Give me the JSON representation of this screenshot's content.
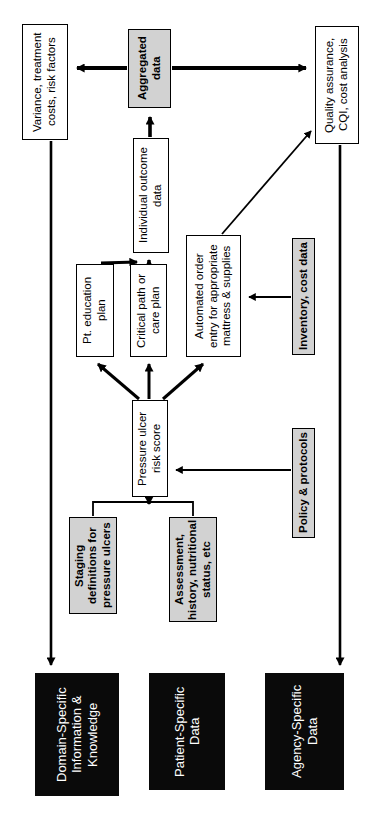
{
  "diagram": {
    "orientation": "rotated-90-ccw",
    "colors": {
      "white_box_fill": "#ffffff",
      "gray_box_fill": "#d2d2d2",
      "black_box_fill": "#0a0a0a",
      "stroke": "#000000",
      "black_box_text": "#ffffff"
    },
    "nodes": [
      {
        "id": "variance",
        "label": "Variance, treatment\ncosts, risk factors",
        "style": "white",
        "x": 22,
        "y": 24,
        "w": 46,
        "h": 116,
        "font": 11.5
      },
      {
        "id": "aggregated",
        "label": "Aggregated\ndata",
        "style": "gray",
        "x": 128,
        "y": 29,
        "w": 43,
        "h": 79,
        "font": 11.5
      },
      {
        "id": "quality",
        "label": "Quality assurance,\nCQI, cost analysis",
        "style": "white",
        "x": 315,
        "y": 26,
        "w": 44,
        "h": 118,
        "font": 11.5
      },
      {
        "id": "individual-outcome",
        "label": "Individual outcome\ndata",
        "style": "white",
        "x": 133,
        "y": 138,
        "w": 36,
        "h": 115,
        "font": 11.5
      },
      {
        "id": "pt-education",
        "label": "Pt. education\nplan",
        "style": "white",
        "x": 76,
        "y": 264,
        "w": 38,
        "h": 93,
        "font": 11.5
      },
      {
        "id": "critical-path",
        "label": "Critical path or\ncare plan",
        "style": "white",
        "x": 130,
        "y": 264,
        "w": 37,
        "h": 93,
        "font": 11.5
      },
      {
        "id": "automated-order",
        "label": "Automated order\nentry for appropriate\nmattress & supplies",
        "style": "white",
        "x": 186,
        "y": 235,
        "w": 55,
        "h": 122,
        "font": 11.5
      },
      {
        "id": "inventory",
        "label": "Inventory, cost data",
        "style": "gray",
        "x": 292,
        "y": 238,
        "w": 23,
        "h": 117,
        "font": 11.5
      },
      {
        "id": "pressure-ulcer",
        "label": "Pressure ulcer\nrisk score",
        "style": "white",
        "x": 132,
        "y": 400,
        "w": 36,
        "h": 97,
        "font": 11.5
      },
      {
        "id": "policy",
        "label": "Policy & protocols",
        "style": "gray",
        "x": 292,
        "y": 428,
        "w": 23,
        "h": 110,
        "font": 11.5
      },
      {
        "id": "staging",
        "label": "Staging\ndefinitions for\npressure ulcers",
        "style": "gray",
        "x": 69,
        "y": 517,
        "w": 48,
        "h": 97,
        "font": 11.5
      },
      {
        "id": "assessment",
        "label": "Assessment,\nhistory, nutritional\nstatus, etc",
        "style": "gray",
        "x": 169,
        "y": 517,
        "w": 48,
        "h": 105,
        "font": 11.5
      },
      {
        "id": "domain-specific",
        "label": "Domain-Specific\nInformation &\nKnowledge",
        "style": "black",
        "x": 35,
        "y": 673,
        "w": 84,
        "h": 123,
        "font": 13
      },
      {
        "id": "patient-specific",
        "label": "Patient-Specific\nData",
        "style": "black",
        "x": 149,
        "y": 673,
        "w": 76,
        "h": 117,
        "font": 13
      },
      {
        "id": "agency-specific",
        "label": "Agency-Specific\nData",
        "style": "black",
        "x": 265,
        "y": 673,
        "w": 79,
        "h": 117,
        "font": 13
      }
    ],
    "edges": [
      {
        "id": "aggregated-to-variance",
        "from": "aggregated",
        "to": "variance",
        "kind": "arrow-thick"
      },
      {
        "id": "aggregated-to-quality",
        "from": "aggregated",
        "to": "quality",
        "kind": "arrow-thick"
      },
      {
        "id": "individual-to-aggregated",
        "from": "individual-outcome",
        "to": "aggregated",
        "kind": "arrow-thick"
      },
      {
        "id": "pt-education-to-individual",
        "from": "pt-education",
        "to": "individual-outcome",
        "kind": "arrow-thick"
      },
      {
        "id": "critical-path-to-individual",
        "from": "critical-path",
        "to": "individual-outcome",
        "kind": "arrow-thick"
      },
      {
        "id": "automated-order-to-quality",
        "from": "automated-order",
        "to": "quality",
        "kind": "arrow-thin"
      },
      {
        "id": "inventory-to-automated-order",
        "from": "inventory",
        "to": "automated-order",
        "kind": "arrow-thin"
      },
      {
        "id": "pressure-ulcer-to-pt-education",
        "from": "pressure-ulcer",
        "to": "pt-education",
        "kind": "arrow-thick"
      },
      {
        "id": "pressure-ulcer-to-critical-path",
        "from": "pressure-ulcer",
        "to": "critical-path",
        "kind": "arrow-thick"
      },
      {
        "id": "pressure-ulcer-to-automated-order",
        "from": "pressure-ulcer",
        "to": "automated-order",
        "kind": "arrow-thick"
      },
      {
        "id": "policy-to-pressure-ulcer",
        "from": "policy",
        "to": "pressure-ulcer",
        "kind": "arrow-thin"
      },
      {
        "id": "staging-assessment-to-pressure-ulcer",
        "from": "staging,assessment",
        "to": "pressure-ulcer",
        "kind": "arrow-join"
      },
      {
        "id": "variance-to-domain-specific",
        "from": "variance",
        "to": "domain-specific",
        "kind": "arrow-thick-long"
      },
      {
        "id": "quality-to-agency-specific",
        "from": "quality",
        "to": "agency-specific",
        "kind": "arrow-thick-long"
      }
    ]
  }
}
